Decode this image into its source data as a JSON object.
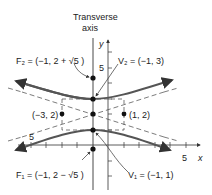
{
  "title": "Transverse axis",
  "title_lines": [
    "Transverse",
    "axis"
  ],
  "axes": {
    "x_label": "x",
    "y_label": "y",
    "x_tick_label": "5",
    "x_neg_tick_label": "5",
    "y_tick_label": "5"
  },
  "points": {
    "F2": {
      "label": "F₂ = (−1, 2 + √5 )",
      "x": -1,
      "y": 4.236
    },
    "V2": {
      "label": "V₂ = (−1, 3)",
      "x": -1,
      "y": 3
    },
    "center_left": {
      "label": "(−3, 2)",
      "x": -3,
      "y": 2
    },
    "center_right": {
      "label": "(1, 2)",
      "x": 1,
      "y": 2
    },
    "V1": {
      "label": "V₁ = (−1, 1)",
      "x": -1,
      "y": 1
    },
    "F1": {
      "label": "F₁ = (−1, 2 − √5 )",
      "x": -1,
      "y": -0.236
    }
  },
  "colors": {
    "curve": "#555555",
    "axis": "#333333",
    "dashed": "#444444",
    "point": "#111111"
  }
}
